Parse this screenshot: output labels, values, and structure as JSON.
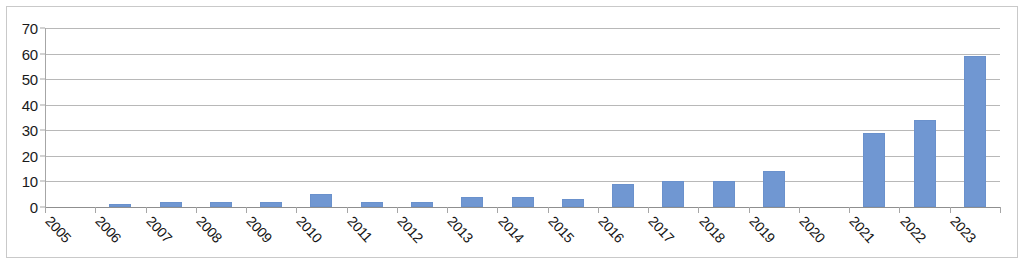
{
  "chart_data": {
    "type": "bar",
    "title": "",
    "subtitle": "",
    "xlabel": "",
    "ylabel": "",
    "categories": [
      "2005",
      "2006",
      "2007",
      "2008",
      "2009",
      "2010",
      "2011",
      "2012",
      "2013",
      "2014",
      "2015",
      "2016",
      "2017",
      "2018",
      "2019",
      "2020",
      "2021",
      "2022",
      "2023"
    ],
    "values": [
      0,
      1,
      2,
      2,
      2,
      5,
      2,
      2,
      4,
      4,
      3,
      9,
      10,
      10,
      14,
      0,
      29,
      34,
      59
    ],
    "series": [
      {
        "name": "",
        "values": [
          0,
          1,
          2,
          2,
          2,
          5,
          2,
          2,
          4,
          4,
          3,
          9,
          10,
          10,
          14,
          0,
          29,
          34,
          59
        ],
        "color": "#7097d2"
      }
    ],
    "ylim": [
      0,
      70
    ],
    "ytick_labels": [
      "0",
      "10",
      "20",
      "30",
      "40",
      "50",
      "60",
      "70"
    ],
    "ytick_values": [
      0,
      10,
      20,
      30,
      40,
      50,
      60,
      70
    ],
    "grid": "horizontal",
    "legend": "none",
    "xtick_rotation": 47,
    "bar_color": "#7097d2",
    "gridline_color": "#b8b8b8",
    "axis_color": "#8f8f8f",
    "background_color": "#ffffff",
    "annotations": []
  }
}
